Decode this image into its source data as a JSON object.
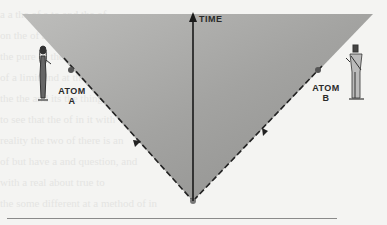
{
  "figure": {
    "type": "light-cone diagram",
    "axis": {
      "label": "TIME",
      "direction": "up"
    },
    "atoms": [
      {
        "id": "A",
        "line1": "ATOM",
        "line2": "A",
        "side": "left"
      },
      {
        "id": "B",
        "line1": "ATOM",
        "line2": "B",
        "side": "right"
      }
    ],
    "colors": {
      "cone_fill": "#9c9c9a",
      "cone_fill_light": "#c2c2c0",
      "line": "#2a2a2a",
      "paper": "#f4f4f2"
    }
  },
  "bleed_through_text": [
    "a a  the  of  a   to  and  the   of",
    "on  the  of  a  then  a  second  of",
    "the  pure  of the  events   it   or",
    "of a  limit  and  at  the  time  of",
    "the  the  and  its  the  thing  the",
    "to  see  that  the  of  in  it  with",
    "reality  the  two  of  there  is  an",
    "of  but  have  a  and  question,  and",
    "with  a  real  about  true  to",
    "the  some  different  at  a  method  of  in"
  ]
}
